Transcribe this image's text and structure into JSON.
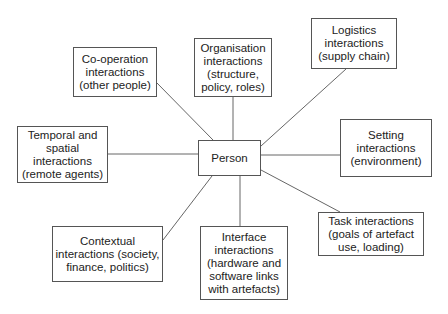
{
  "diagram": {
    "type": "hub-and-spoke",
    "center": {
      "id": "person",
      "label": "Person"
    },
    "nodes": [
      {
        "id": "cooperation",
        "lines": [
          "Co-operation",
          "interactions",
          "(other people)"
        ]
      },
      {
        "id": "organisation",
        "lines": [
          "Organisation",
          "interactions",
          "(structure,",
          "policy, roles)"
        ]
      },
      {
        "id": "logistics",
        "lines": [
          "Logistics",
          "interactions",
          "(supply chain)"
        ]
      },
      {
        "id": "temporal",
        "lines": [
          "Temporal and",
          "spatial interactions",
          "(remote agents)"
        ]
      },
      {
        "id": "setting",
        "lines": [
          "Setting",
          "interactions",
          "(environment)"
        ]
      },
      {
        "id": "contextual",
        "lines": [
          "Contextual",
          "interactions (society,",
          "finance, politics)"
        ]
      },
      {
        "id": "interface",
        "lines": [
          "Interface",
          "interactions",
          "(hardware and",
          "software links",
          "with artefacts)"
        ]
      },
      {
        "id": "task",
        "lines": [
          "Task interactions",
          "(goals of artefact",
          "use, loading)"
        ]
      }
    ],
    "edges": [
      [
        "person",
        "cooperation"
      ],
      [
        "person",
        "organisation"
      ],
      [
        "person",
        "logistics"
      ],
      [
        "person",
        "temporal"
      ],
      [
        "person",
        "setting"
      ],
      [
        "person",
        "contextual"
      ],
      [
        "person",
        "interface"
      ],
      [
        "person",
        "task"
      ]
    ]
  }
}
